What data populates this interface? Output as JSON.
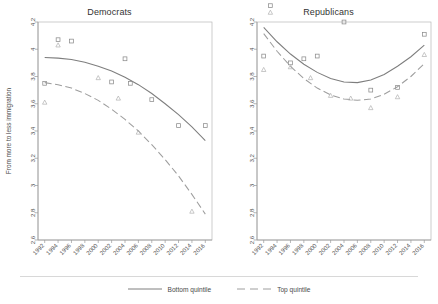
{
  "figure": {
    "ylabel": "From more to less immigration"
  },
  "legend": {
    "items": [
      {
        "label": "Bottom quintile",
        "style": "solid",
        "color": "#7e7e7e"
      },
      {
        "label": "Top quintile",
        "style": "dashed",
        "color": "#9e9e9e"
      }
    ]
  },
  "chart_data": [
    {
      "type": "scatter",
      "title": "Democrats",
      "xlabel": "",
      "ylabel": "From more to less immigration",
      "xlim": [
        1991,
        2017
      ],
      "ylim": [
        2.6,
        4.2
      ],
      "yticks": [
        2.6,
        2.8,
        3,
        3.2,
        3.4,
        3.6,
        3.8,
        4,
        4.2
      ],
      "ytick_labels": [
        "2.6",
        "2.8",
        "3",
        "3.2",
        "3.4",
        "3.6",
        "3.8",
        "4",
        "4.2"
      ],
      "xticks": [
        1992,
        1994,
        1996,
        1998,
        2000,
        2002,
        2004,
        2006,
        2008,
        2010,
        2012,
        2014,
        2016
      ],
      "xtick_labels": [
        "1992",
        "1994",
        "1996",
        "1998",
        "2000",
        "2002",
        "2004",
        "2006",
        "2008",
        "2010",
        "2012",
        "2014",
        "2016"
      ],
      "grid": false,
      "legend_position": "below-figure",
      "series": [
        {
          "name": "Bottom quintile",
          "marker": "square",
          "line": "solid",
          "color": "#8c8c8c",
          "points": [
            {
              "x": 1994,
              "y": 4.07
            },
            {
              "x": 1996,
              "y": 4.06
            },
            {
              "x": 1992,
              "y": 3.75
            },
            {
              "x": 2004,
              "y": 3.93
            },
            {
              "x": 2002,
              "y": 3.76
            },
            {
              "x": 2004.8,
              "y": 3.75
            },
            {
              "x": 2008,
              "y": 3.63
            },
            {
              "x": 2012,
              "y": 3.44
            },
            {
              "x": 2016,
              "y": 3.44
            }
          ],
          "fit": {
            "type": "quadratic",
            "points": [
              {
                "x": 1992,
                "y": 3.94
              },
              {
                "x": 1994,
                "y": 3.935
              },
              {
                "x": 1996,
                "y": 3.925
              },
              {
                "x": 1998,
                "y": 3.905
              },
              {
                "x": 2000,
                "y": 3.875
              },
              {
                "x": 2002,
                "y": 3.84
              },
              {
                "x": 2004,
                "y": 3.795
              },
              {
                "x": 2006,
                "y": 3.74
              },
              {
                "x": 2008,
                "y": 3.675
              },
              {
                "x": 2010,
                "y": 3.6
              },
              {
                "x": 2012,
                "y": 3.52
              },
              {
                "x": 2014,
                "y": 3.43
              },
              {
                "x": 2016,
                "y": 3.33
              }
            ]
          }
        },
        {
          "name": "Top quintile",
          "marker": "triangle",
          "line": "dashed",
          "color": "#b0b0b0",
          "points": [
            {
              "x": 1994,
              "y": 4.03
            },
            {
              "x": 1992,
              "y": 3.61
            },
            {
              "x": 2000,
              "y": 3.79
            },
            {
              "x": 2003,
              "y": 3.64
            },
            {
              "x": 2006,
              "y": 3.39
            },
            {
              "x": 2014,
              "y": 2.81
            }
          ],
          "fit": {
            "type": "quadratic",
            "points": [
              {
                "x": 1992,
                "y": 3.755
              },
              {
                "x": 1994,
                "y": 3.74
              },
              {
                "x": 1996,
                "y": 3.715
              },
              {
                "x": 1998,
                "y": 3.675
              },
              {
                "x": 2000,
                "y": 3.625
              },
              {
                "x": 2002,
                "y": 3.56
              },
              {
                "x": 2004,
                "y": 3.485
              },
              {
                "x": 2006,
                "y": 3.4
              },
              {
                "x": 2008,
                "y": 3.3
              },
              {
                "x": 2010,
                "y": 3.19
              },
              {
                "x": 2012,
                "y": 3.07
              },
              {
                "x": 2014,
                "y": 2.935
              },
              {
                "x": 2016,
                "y": 2.79
              }
            ]
          }
        }
      ]
    },
    {
      "type": "scatter",
      "title": "Republicans",
      "xlabel": "",
      "ylabel": "",
      "xlim": [
        1991,
        2017
      ],
      "ylim": [
        2.6,
        4.2
      ],
      "yticks": [
        2.6,
        2.8,
        3,
        3.2,
        3.4,
        3.6,
        3.8,
        4,
        4.2
      ],
      "ytick_labels": [
        "2.6",
        "2.8",
        "3",
        "3.2",
        "3.4",
        "3.6",
        "3.8",
        "4",
        "4.2"
      ],
      "xticks": [
        1992,
        1994,
        1996,
        1998,
        2000,
        2002,
        2004,
        2006,
        2008,
        2010,
        2012,
        2014,
        2016
      ],
      "xtick_labels": [
        "1992",
        "1994",
        "1996",
        "1998",
        "2000",
        "2002",
        "2004",
        "2006",
        "2008",
        "2010",
        "2012",
        "2014",
        "2016"
      ],
      "grid": false,
      "legend_position": "below-figure",
      "series": [
        {
          "name": "Bottom quintile",
          "marker": "square",
          "line": "solid",
          "color": "#8c8c8c",
          "points": [
            {
              "x": 1993,
              "y": 4.32
            },
            {
              "x": 1992,
              "y": 3.95
            },
            {
              "x": 1996,
              "y": 3.9
            },
            {
              "x": 1998,
              "y": 3.93
            },
            {
              "x": 2000,
              "y": 3.95
            },
            {
              "x": 2004,
              "y": 4.2
            },
            {
              "x": 2008,
              "y": 3.7
            },
            {
              "x": 2012,
              "y": 3.72
            },
            {
              "x": 2016,
              "y": 4.11
            }
          ],
          "fit": {
            "type": "quadratic",
            "points": [
              {
                "x": 1992,
                "y": 4.16
              },
              {
                "x": 1994,
                "y": 4.055
              },
              {
                "x": 1996,
                "y": 3.965
              },
              {
                "x": 1998,
                "y": 3.89
              },
              {
                "x": 2000,
                "y": 3.83
              },
              {
                "x": 2002,
                "y": 3.785
              },
              {
                "x": 2004,
                "y": 3.76
              },
              {
                "x": 2006,
                "y": 3.755
              },
              {
                "x": 2008,
                "y": 3.775
              },
              {
                "x": 2010,
                "y": 3.815
              },
              {
                "x": 2012,
                "y": 3.875
              },
              {
                "x": 2014,
                "y": 3.945
              },
              {
                "x": 2016,
                "y": 4.03
              }
            ]
          }
        },
        {
          "name": "Top quintile",
          "marker": "triangle",
          "line": "dashed",
          "color": "#b0b0b0",
          "points": [
            {
              "x": 1993,
              "y": 4.27
            },
            {
              "x": 1992,
              "y": 3.85
            },
            {
              "x": 1996,
              "y": 3.87
            },
            {
              "x": 1999,
              "y": 3.79
            },
            {
              "x": 2002,
              "y": 3.66
            },
            {
              "x": 2005,
              "y": 3.64
            },
            {
              "x": 2008,
              "y": 3.57
            },
            {
              "x": 2012,
              "y": 3.65
            },
            {
              "x": 2016,
              "y": 3.96
            }
          ],
          "fit": {
            "type": "quadratic",
            "points": [
              {
                "x": 1992,
                "y": 4.115
              },
              {
                "x": 1994,
                "y": 3.985
              },
              {
                "x": 1996,
                "y": 3.875
              },
              {
                "x": 1998,
                "y": 3.785
              },
              {
                "x": 2000,
                "y": 3.715
              },
              {
                "x": 2002,
                "y": 3.665
              },
              {
                "x": 2004,
                "y": 3.635
              },
              {
                "x": 2006,
                "y": 3.625
              },
              {
                "x": 2008,
                "y": 3.635
              },
              {
                "x": 2010,
                "y": 3.67
              },
              {
                "x": 2012,
                "y": 3.725
              },
              {
                "x": 2014,
                "y": 3.8
              },
              {
                "x": 2016,
                "y": 3.895
              }
            ]
          }
        }
      ]
    }
  ]
}
